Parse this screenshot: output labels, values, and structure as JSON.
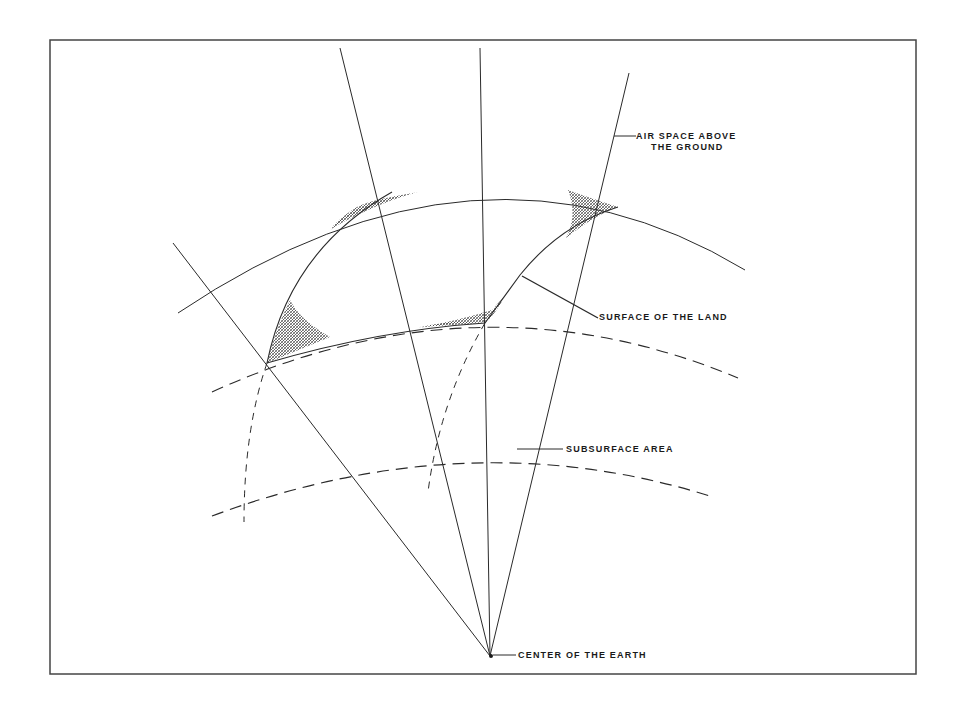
{
  "diagram": {
    "type": "cross-section of earth sector showing property boundaries",
    "colors": {
      "background": "#ffffff",
      "line": "#2a2a2a",
      "hatch": "#3a3a3a",
      "frame": "#444444"
    },
    "labels": {
      "air_space_line1": "AIR SPACE ABOVE",
      "air_space_line2": "THE GROUND",
      "surface": "SURFACE OF THE LAND",
      "subsurface": "SUBSURFACE AREA",
      "center": "CENTER OF THE EARTH"
    }
  }
}
